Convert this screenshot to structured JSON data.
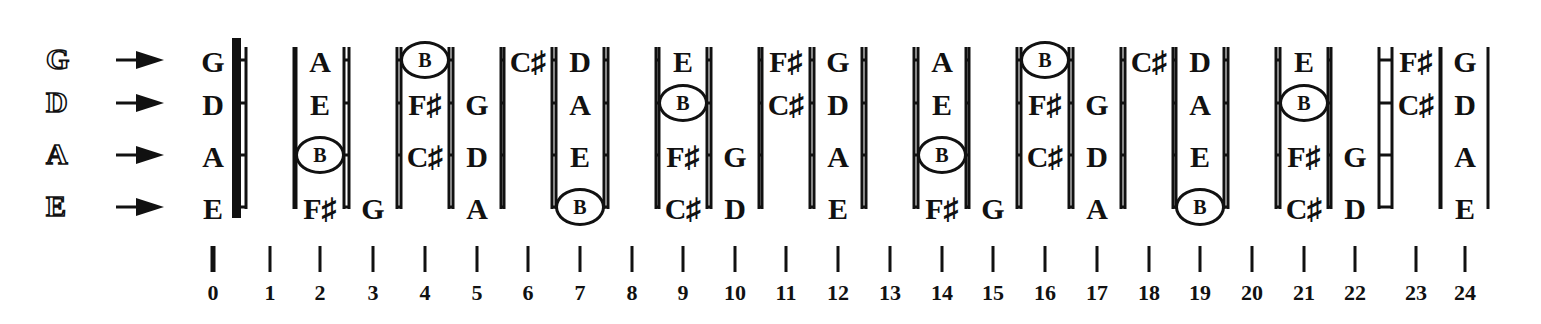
{
  "strings": [
    {
      "name": "G",
      "y": 60
    },
    {
      "name": "D",
      "y": 103
    },
    {
      "name": "A",
      "y": 155
    },
    {
      "name": "E",
      "y": 207
    }
  ],
  "open_labels": [
    "G",
    "D",
    "A",
    "E"
  ],
  "fret_x": [
    213,
    270,
    320,
    373,
    425,
    477,
    528,
    580,
    632,
    683,
    735,
    786,
    838,
    890,
    942,
    993,
    1045,
    1097,
    1149,
    1200,
    1252,
    1304,
    1355,
    1416,
    1465
  ],
  "fret_numbers": [
    "0",
    "1",
    "2",
    "3",
    "4",
    "5",
    "6",
    "7",
    "8",
    "9",
    "10",
    "11",
    "12",
    "13",
    "14",
    "15",
    "16",
    "17",
    "18",
    "19",
    "20",
    "21",
    "22",
    "23",
    "24"
  ],
  "notes": {
    "G": [
      "G",
      "G#",
      "A",
      "A#",
      "B",
      "C",
      "C#",
      "D",
      "D#",
      "E",
      "F",
      "F#",
      "G",
      "G#",
      "A",
      "A#",
      "B",
      "C",
      "C#",
      "D",
      "D#",
      "E",
      "F",
      "F#",
      "G"
    ],
    "D": [
      "D",
      "D#",
      "E",
      "F",
      "F#",
      "G",
      "G#",
      "A",
      "A#",
      "B",
      "C",
      "C#",
      "D",
      "D#",
      "E",
      "F",
      "F#",
      "G",
      "G#",
      "A",
      "A#",
      "B",
      "C",
      "C#",
      "D"
    ],
    "A": [
      "A",
      "A#",
      "B",
      "C",
      "C#",
      "D",
      "D#",
      "E",
      "F",
      "F#",
      "G",
      "G#",
      "A",
      "A#",
      "B",
      "C",
      "C#",
      "D",
      "D#",
      "E",
      "F",
      "F#",
      "G",
      "G#",
      "A"
    ],
    "E": [
      "E",
      "F",
      "F#",
      "G",
      "G#",
      "A",
      "A#",
      "B",
      "C",
      "C#",
      "D",
      "D#",
      "E",
      "F",
      "F#",
      "G",
      "G#",
      "A",
      "A#",
      "B",
      "C",
      "C#",
      "D",
      "D#",
      "E"
    ]
  },
  "displayed_scale": [
    "G",
    "A",
    "B",
    "C♯",
    "D",
    "E",
    "F♯"
  ],
  "highlighted_note": "B",
  "colors": {
    "ink": "#111111",
    "background": "#ffffff"
  }
}
